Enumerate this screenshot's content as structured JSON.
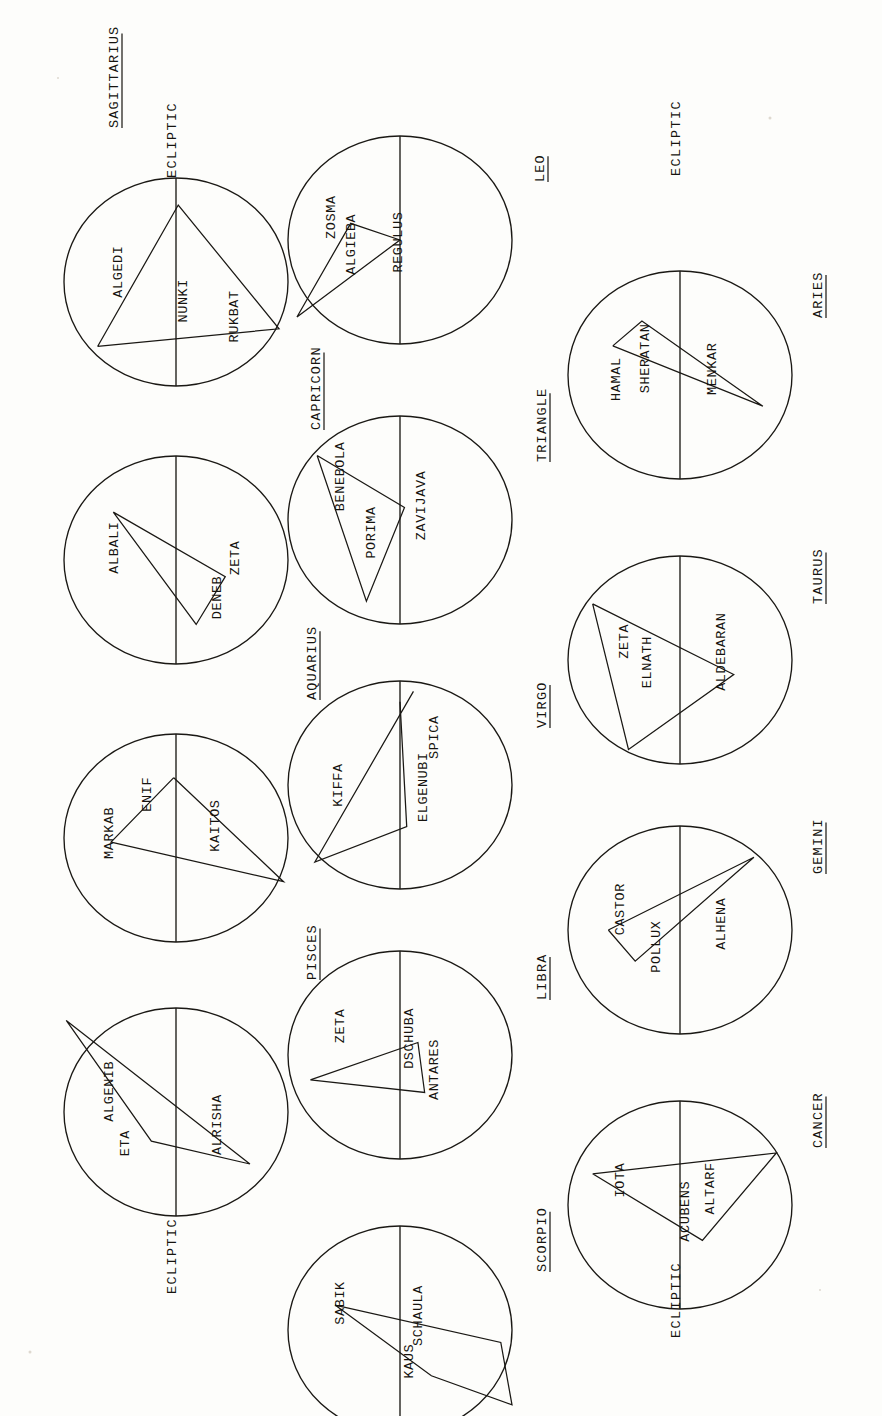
{
  "plate": {
    "orientation": "rotated-90",
    "ink_color": "#16140f",
    "paper_color": "#fdfdfb",
    "ecliptic_label": "ECLIPTIC"
  },
  "ecliptic_labels": [
    {
      "id": "ecliptic-row1-left",
      "text": "ECLIPTIC"
    },
    {
      "id": "ecliptic-row1-right",
      "text": "ECLIPTIC"
    },
    {
      "id": "ecliptic-row2-left",
      "text": "ECLIPTIC"
    },
    {
      "id": "ecliptic-row2-right",
      "text": "ECLIPTIC"
    }
  ],
  "constellations": [
    {
      "name": "SAGITTARIUS",
      "stars": [
        {
          "label": "ALGEDI",
          "x": 0.22,
          "y": 0.3
        },
        {
          "label": "NUNKI",
          "x": 0.56,
          "y": 0.41
        },
        {
          "label": "RUKBAT",
          "x": 0.66,
          "y": 0.72
        }
      ],
      "pattern": [
        [
          0.14,
          0.76
        ],
        [
          0.62,
          0.23
        ],
        [
          1.06,
          0.74
        ],
        [
          0.14,
          0.76
        ]
      ]
    },
    {
      "name": "CAPRICORN",
      "stars": [
        {
          "label": "ALBALI",
          "x": 0.22,
          "y": 0.34
        },
        {
          "label": "DENEB",
          "x": 0.64,
          "y": 0.7
        },
        {
          "label": "ZETA",
          "x": 0.74,
          "y": 0.38
        }
      ],
      "pattern": [
        [
          0.28,
          0.26
        ],
        [
          0.84,
          0.6
        ],
        [
          0.6,
          0.82
        ],
        [
          0.28,
          0.26
        ]
      ]
    },
    {
      "name": "AQUARIUS",
      "stars": [
        {
          "label": "MARKAB",
          "x": 0.24,
          "y": 0.38
        },
        {
          "label": "ENIF",
          "x": 0.36,
          "y": 0.22
        },
        {
          "label": "KAITOS",
          "x": 0.68,
          "y": 0.3
        }
      ],
      "pattern": [
        [
          0.5,
          0.26
        ],
        [
          0.22,
          0.57
        ],
        [
          1.06,
          0.77
        ],
        [
          0.5,
          0.26
        ]
      ]
    },
    {
      "name": "PISCES",
      "stars": [
        {
          "label": "ALGENIB",
          "x": 0.24,
          "y": 0.28
        },
        {
          "label": "ETA",
          "x": 0.28,
          "y": 0.55
        },
        {
          "label": "ALRISHA",
          "x": 0.7,
          "y": 0.46
        }
      ],
      "pattern": [
        [
          -0.06,
          0.06
        ],
        [
          0.35,
          0.63
        ],
        [
          0.82,
          0.75
        ],
        [
          -0.06,
          0.06
        ]
      ]
    },
    {
      "name": "LEO",
      "stars": [
        {
          "label": "ZOSMA",
          "x": 0.22,
          "y": 0.33
        },
        {
          "label": "ALGIEBA",
          "x": 0.3,
          "y": 0.47
        },
        {
          "label": "REGULUS",
          "x": 0.52,
          "y": 0.46
        }
      ],
      "pattern": [
        [
          0.5,
          0.46
        ],
        [
          0.26,
          0.37
        ],
        [
          0.04,
          0.84
        ],
        [
          0.5,
          0.46
        ]
      ]
    },
    {
      "name": "TRIANGLE",
      "stars": [
        {
          "label": "BENEBOLA",
          "x": 0.26,
          "y": 0.24
        },
        {
          "label": "PORIMA",
          "x": 0.4,
          "y": 0.54
        },
        {
          "label": "ZAVIJAVA",
          "x": 0.6,
          "y": 0.4
        }
      ],
      "pattern": [
        [
          0.14,
          0.17
        ],
        [
          0.52,
          0.42
        ],
        [
          0.35,
          0.88
        ],
        [
          0.14,
          0.17
        ]
      ]
    },
    {
      "name": "VIRGO",
      "stars": [
        {
          "label": "KIFFA",
          "x": 0.25,
          "y": 0.48
        },
        {
          "label": "ELGENUBI",
          "x": 0.62,
          "y": 0.5
        },
        {
          "label": "SPICA",
          "x": 0.66,
          "y": 0.26
        }
      ],
      "pattern": [
        [
          0.56,
          0.08
        ],
        [
          0.14,
          0.86
        ],
        [
          0.53,
          0.7
        ],
        [
          0.5,
          0.12
        ]
      ]
    },
    {
      "name": "LIBRA",
      "stars": [
        {
          "label": "ZETA",
          "x": 0.25,
          "y": 0.34
        },
        {
          "label": "DSCHUBA",
          "x": 0.56,
          "y": 0.4
        },
        {
          "label": "ANTARES",
          "x": 0.66,
          "y": 0.56
        }
      ],
      "pattern": [
        [
          0.12,
          0.62
        ],
        [
          0.58,
          0.44
        ],
        [
          0.6,
          0.67
        ],
        [
          0.12,
          0.62
        ]
      ]
    },
    {
      "name": "ARIES",
      "stars": [
        {
          "label": "HAMAL",
          "x": 0.23,
          "y": 0.5
        },
        {
          "label": "SHERATAN",
          "x": 0.34,
          "y": 0.4
        },
        {
          "label": "MENKAR",
          "x": 0.68,
          "y": 0.44
        }
      ],
      "pattern": [
        [
          0.17,
          0.38
        ],
        [
          0.3,
          0.26
        ],
        [
          0.86,
          0.65
        ],
        [
          0.17,
          0.38
        ]
      ]
    },
    {
      "name": "TAURUS",
      "stars": [
        {
          "label": "ZETA",
          "x": 0.26,
          "y": 0.38
        },
        {
          "label": "ELNATH",
          "x": 0.36,
          "y": 0.48
        },
        {
          "label": "ALDEBARAN",
          "x": 0.7,
          "y": 0.44
        }
      ],
      "pattern": [
        [
          0.12,
          0.22
        ],
        [
          0.74,
          0.56
        ],
        [
          0.26,
          0.92
        ],
        [
          0.12,
          0.22
        ]
      ]
    },
    {
      "name": "GEMINI",
      "stars": [
        {
          "label": "CASTOR",
          "x": 0.24,
          "y": 0.38
        },
        {
          "label": "POLLUX",
          "x": 0.4,
          "y": 0.56
        },
        {
          "label": "ALHENA",
          "x": 0.7,
          "y": 0.44
        }
      ],
      "pattern": [
        [
          0.18,
          0.46
        ],
        [
          0.82,
          0.14
        ],
        [
          0.3,
          0.62
        ],
        [
          0.18,
          0.46
        ]
      ]
    },
    {
      "name": "CANCER",
      "stars": [
        {
          "label": "IOTA",
          "x": 0.24,
          "y": 0.36
        },
        {
          "label": "ACUBENS",
          "x": 0.55,
          "y": 0.52
        },
        {
          "label": "ALTARF",
          "x": 0.66,
          "y": 0.4
        }
      ],
      "pattern": [
        [
          0.12,
          0.34
        ],
        [
          0.92,
          0.24
        ],
        [
          0.6,
          0.66
        ],
        [
          0.12,
          0.34
        ]
      ]
    }
  ]
}
